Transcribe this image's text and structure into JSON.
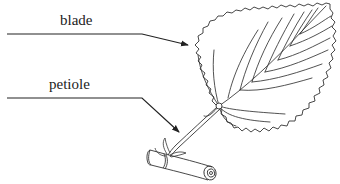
{
  "diagram": {
    "labels": [
      {
        "id": "blade",
        "text": "blade",
        "points_to": "leaf blade"
      },
      {
        "id": "petiole",
        "text": "petiole",
        "points_to": "leaf stalk"
      }
    ],
    "colors": {
      "background": "#ffffff",
      "ink": "#222222"
    }
  }
}
